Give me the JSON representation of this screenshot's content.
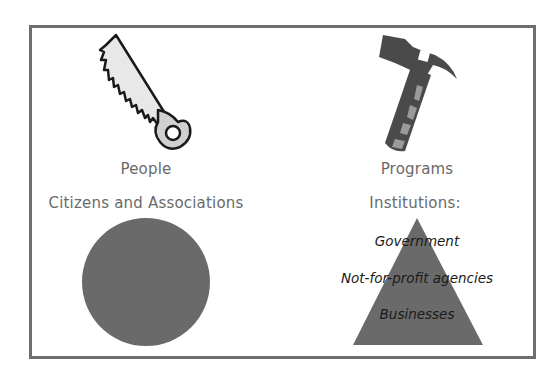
{
  "left": {
    "tool_icon": "saw-icon",
    "title": "People",
    "subtitle": "Citizens and Associations",
    "shape": "circle"
  },
  "right": {
    "tool_icon": "hammer-icon",
    "title": "Programs",
    "subtitle": "Institutions:",
    "shape": "triangle",
    "pyramid_items": [
      "Government",
      "Not-for-profit agencies",
      "Businesses"
    ]
  },
  "colors": {
    "frame": "#6e6e6e",
    "shape_fill": "#6a6a6a",
    "label_text": "#6a6a6a",
    "pyramid_text": "#1a1a1a"
  }
}
